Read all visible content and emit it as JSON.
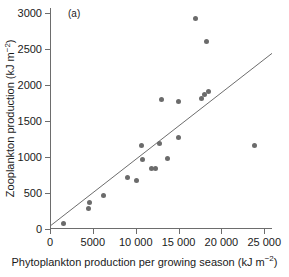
{
  "panel": {
    "label": "(a)"
  },
  "axes": {
    "x": {
      "title": "Phytoplankton production per growing season (kJ m",
      "title_exponent": "−2",
      "title_close": ")",
      "ticks": [
        0,
        5000,
        10000,
        15000,
        20000,
        25000
      ],
      "tick_labels": [
        "0",
        "5000",
        "10 000",
        "15 000",
        "20 000",
        "25 000"
      ],
      "min": 0,
      "max": 25900
    },
    "y": {
      "title": "Zooplankton production (kJ m",
      "title_exponent": "−2",
      "title_close": ")",
      "ticks": [
        0,
        500,
        1000,
        1500,
        2000,
        2500,
        3000
      ],
      "tick_labels": [
        "0",
        "500",
        "1000",
        "1500",
        "2000",
        "2500",
        "3000"
      ],
      "min": 0,
      "max": 3070
    }
  },
  "colors": {
    "marker": "#6b6b6b",
    "line": "#6d6d6d",
    "axis": "#6d6d6d",
    "text": "#1a1a1a",
    "background": "#ffffff"
  },
  "chart_data": {
    "type": "scatter",
    "title": "(a)",
    "xlabel": "Phytoplankton production per growing season (kJ m−2)",
    "ylabel": "Zooplankton production (kJ m−2)",
    "xlim": [
      0,
      25900
    ],
    "ylim": [
      0,
      3070
    ],
    "grid": false,
    "legend": "none",
    "x": [
      1600,
      4500,
      4550,
      6200,
      9000,
      10100,
      10700,
      10800,
      11800,
      12300,
      12800,
      13000,
      13700,
      15000,
      15000,
      17000,
      17700,
      18000,
      18300,
      18500,
      23800
    ],
    "y": [
      80,
      290,
      365,
      470,
      720,
      680,
      1165,
      960,
      845,
      845,
      1185,
      1800,
      980,
      1265,
      1775,
      2930,
      1810,
      1875,
      2610,
      1915,
      1165
    ],
    "points": [
      {
        "x": 1600,
        "y": 80
      },
      {
        "x": 4500,
        "y": 290
      },
      {
        "x": 4550,
        "y": 365
      },
      {
        "x": 6200,
        "y": 470
      },
      {
        "x": 9000,
        "y": 720
      },
      {
        "x": 10100,
        "y": 680
      },
      {
        "x": 10700,
        "y": 1165
      },
      {
        "x": 10800,
        "y": 960
      },
      {
        "x": 11800,
        "y": 845
      },
      {
        "x": 12300,
        "y": 845
      },
      {
        "x": 12800,
        "y": 1185
      },
      {
        "x": 13000,
        "y": 1800
      },
      {
        "x": 13700,
        "y": 980
      },
      {
        "x": 15000,
        "y": 1265
      },
      {
        "x": 15000,
        "y": 1775
      },
      {
        "x": 17000,
        "y": 2930
      },
      {
        "x": 17700,
        "y": 1810
      },
      {
        "x": 18000,
        "y": 1875
      },
      {
        "x": 18300,
        "y": 2610
      },
      {
        "x": 18500,
        "y": 1915
      },
      {
        "x": 23800,
        "y": 1165
      }
    ],
    "fit_line": {
      "type": "linear",
      "x_start": 0,
      "y_start": 40,
      "x_end": 25900,
      "y_end": 2440
    }
  }
}
